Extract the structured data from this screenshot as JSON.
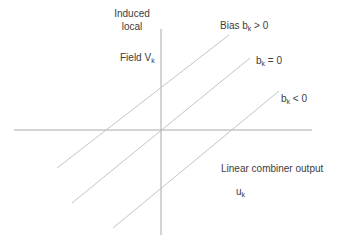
{
  "diagram": {
    "y_axis": {
      "label_lines": [
        "Induced",
        "local"
      ],
      "label_field": "Field V",
      "label_field_sub": "k"
    },
    "x_axis": {
      "label": "Linear combiner output",
      "symbol": "u",
      "symbol_sub": "k"
    },
    "lines": [
      {
        "label_prefix": "Bias b",
        "label_sub": "k",
        "label_suffix": " > 0",
        "x1": 57,
        "y1": 168,
        "x2": 229,
        "y2": 35
      },
      {
        "label_prefix": "b",
        "label_sub": "k",
        "label_suffix": " = 0",
        "x1": 72,
        "y1": 203,
        "x2": 250,
        "y2": 58
      },
      {
        "label_prefix": "b",
        "label_sub": "k",
        "label_suffix": " < 0",
        "x1": 113,
        "y1": 228,
        "x2": 279,
        "y2": 91
      }
    ],
    "axes": {
      "horizontal": {
        "x1": 14,
        "y1": 130,
        "x2": 312,
        "y2": 130
      },
      "vertical": {
        "x1": 161,
        "y1": 29,
        "x2": 161,
        "y2": 235
      }
    },
    "colors": {
      "axis": "#a8a8a8",
      "line": "#c4c4c4",
      "text": "#3c3c3c"
    }
  }
}
